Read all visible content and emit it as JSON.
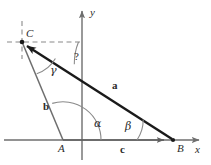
{
  "figure": {
    "kind": "vector-triangle-diagram",
    "title": "",
    "background_color": "#ffffff",
    "stroke_color": "#6e6e6e",
    "vector_color": "#1a1a1a",
    "dash_color": "#8a8a8a",
    "text_color": "#2b2b2b",
    "width": 211,
    "height": 165
  },
  "axes": {
    "x_label": "x",
    "y_label": "y",
    "origin_label": "A",
    "x_axis_y": 140,
    "y_axis_x": 82
  },
  "points": [
    {
      "name": "C",
      "label": "C",
      "x": 22,
      "y": 42
    },
    {
      "name": "A",
      "label": "A",
      "x": 63,
      "y": 140
    },
    {
      "name": "B",
      "label": "B",
      "x": 173,
      "y": 140
    }
  ],
  "vectors": [
    {
      "name": "a",
      "label": "a",
      "from": "B",
      "to": "C",
      "label_x": 112,
      "label_y": 80
    },
    {
      "name": "c",
      "label": "c",
      "from": "A",
      "to": "B",
      "label_x": 120,
      "label_y": 144
    }
  ],
  "segments": [
    {
      "name": "b",
      "label": "b",
      "from": "A",
      "to": "C",
      "label_x": 43,
      "label_y": 101
    }
  ],
  "angles": [
    {
      "name": "alpha",
      "label": "α",
      "at": "A",
      "label_x": 94,
      "label_y": 118
    },
    {
      "name": "beta",
      "label": "β",
      "at": "B",
      "label_x": 125,
      "label_y": 121
    },
    {
      "name": "gamma",
      "label": "γ",
      "at": "C",
      "label_x": 50,
      "label_y": 65
    },
    {
      "name": "unknown",
      "label": "?",
      "at": "C",
      "label_x": 74,
      "label_y": 51
    }
  ],
  "dashed_guides": [
    {
      "name": "horizontal-through-C",
      "x1": 7,
      "y1": 42,
      "x2": 83,
      "y2": 42
    },
    {
      "name": "vertical-through-C",
      "x1": 22,
      "y1": 21,
      "x2": 22,
      "y2": 59
    }
  ]
}
